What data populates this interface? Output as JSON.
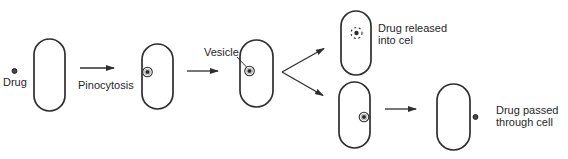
{
  "diagram": {
    "labels": {
      "drug": "Drug",
      "pinocytosis": "Pinocytosis",
      "vesicle": "Vesicle",
      "drug_released_line1": "Drug released",
      "drug_released_line2": "into cel",
      "drug_passed_line1": "Drug passed",
      "drug_passed_line2": "through cell"
    },
    "icons": {
      "drug_particle": "small-filled-dot",
      "vesicle": "circled-dot",
      "released_vesicle": "dashed-circled-dot"
    },
    "colors": {
      "ink": "#2e2e2e",
      "text": "#1f1f1f",
      "background": "#ffffff"
    }
  }
}
